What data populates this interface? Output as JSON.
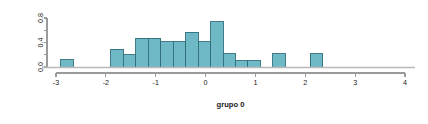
{
  "chart_data": {
    "type": "bar",
    "chart_subtype": "histogram",
    "title": "",
    "xlabel": "grupo 0",
    "ylabel": "",
    "xlim": [
      -3.2,
      4.0
    ],
    "ylim": [
      0.0,
      0.88
    ],
    "grid": false,
    "legend": null,
    "bin_width": 0.25,
    "bar_fill_color": "#6FB9C6",
    "bar_border_color": "#2F6E79",
    "axis_color": "#9A9A9A",
    "text_color": "#1A1A1A",
    "background_color": "#FFFFFF",
    "x_ticks": [
      -3,
      -2,
      -1,
      0,
      1,
      2,
      3,
      4
    ],
    "x_tick_labels": [
      "-3",
      "-2",
      "-1",
      "0",
      "1",
      "2",
      "3",
      "4"
    ],
    "y_ticks": [
      0.0,
      0.2,
      0.4,
      0.6,
      0.8
    ],
    "y_tick_labels": [
      "0.0",
      "",
      "0.4",
      "",
      "0.8"
    ],
    "bins": [
      {
        "x0": -3.0,
        "x1": -2.75,
        "value": 0.12
      },
      {
        "x0": -2.75,
        "x1": -2.5,
        "value": 0.0
      },
      {
        "x0": -2.5,
        "x1": -2.25,
        "value": 0.0
      },
      {
        "x0": -2.25,
        "x1": -2.0,
        "value": 0.0
      },
      {
        "x0": -2.0,
        "x1": -1.75,
        "value": 0.29
      },
      {
        "x0": -1.75,
        "x1": -1.5,
        "value": 0.2
      },
      {
        "x0": -1.5,
        "x1": -1.25,
        "value": 0.47
      },
      {
        "x0": -1.25,
        "x1": -1.0,
        "value": 0.47
      },
      {
        "x0": -1.0,
        "x1": -0.75,
        "value": 0.41
      },
      {
        "x0": -0.75,
        "x1": -0.5,
        "value": 0.41
      },
      {
        "x0": -0.5,
        "x1": -0.25,
        "value": 0.57
      },
      {
        "x0": -0.25,
        "x1": 0.0,
        "value": 0.41
      },
      {
        "x0": 0.0,
        "x1": 0.25,
        "value": 0.74
      },
      {
        "x0": 0.25,
        "x1": 0.5,
        "value": 0.22
      },
      {
        "x0": 0.5,
        "x1": 0.75,
        "value": 0.1
      },
      {
        "x0": 0.75,
        "x1": 1.0,
        "value": 0.1
      },
      {
        "x0": 1.0,
        "x1": 1.25,
        "value": 0.0
      },
      {
        "x0": 1.25,
        "x1": 1.5,
        "value": 0.22
      },
      {
        "x0": 1.5,
        "x1": 1.75,
        "value": 0.0
      },
      {
        "x0": 1.75,
        "x1": 2.0,
        "value": 0.0
      },
      {
        "x0": 2.0,
        "x1": 2.25,
        "value": 0.22
      }
    ],
    "bin_offset": -2.9
  }
}
